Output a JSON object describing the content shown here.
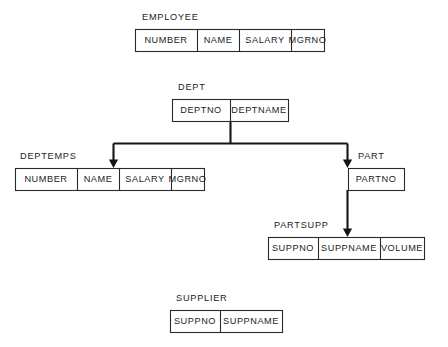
{
  "diagram": {
    "type": "database-schema-hierarchy",
    "background_color": "#ffffff",
    "stroke_color": "#151515",
    "text_color": "#1b1b1b",
    "entities": [
      {
        "id": "employee",
        "label": "EMPLOYEE",
        "label_x": 142,
        "label_y": 20,
        "box": {
          "x": 135,
          "y": 29,
          "width": 189,
          "height": 22
        },
        "columns": [
          {
            "name": "NUMBER",
            "x": 135,
            "width": 62
          },
          {
            "name": "NAME",
            "x": 197,
            "width": 42
          },
          {
            "name": "SALARY",
            "x": 239,
            "width": 52
          },
          {
            "name": "MGRNO",
            "x": 291,
            "width": 33
          }
        ]
      },
      {
        "id": "dept",
        "label": "DEPT",
        "label_x": 178,
        "label_y": 90,
        "box": {
          "x": 172,
          "y": 99,
          "width": 116,
          "height": 22
        },
        "columns": [
          {
            "name": "DEPTNO",
            "x": 172,
            "width": 58
          },
          {
            "name": "DEPTNAME",
            "x": 230,
            "width": 58
          }
        ]
      },
      {
        "id": "deptemps",
        "label": "DEPTEMPS",
        "label_x": 20,
        "label_y": 159,
        "box": {
          "x": 15,
          "y": 168,
          "width": 189,
          "height": 22
        },
        "columns": [
          {
            "name": "NUMBER",
            "x": 15,
            "width": 62
          },
          {
            "name": "NAME",
            "x": 77,
            "width": 42
          },
          {
            "name": "SALARY",
            "x": 119,
            "width": 52
          },
          {
            "name": "MGRNO",
            "x": 171,
            "width": 33
          }
        ]
      },
      {
        "id": "part",
        "label": "PART",
        "label_x": 358,
        "label_y": 159,
        "box": {
          "x": 348,
          "y": 168,
          "width": 56,
          "height": 22
        },
        "columns": [
          {
            "name": "PARTNO",
            "x": 348,
            "width": 56
          }
        ]
      },
      {
        "id": "partsupp",
        "label": "PARTSUPP",
        "label_x": 274,
        "label_y": 228,
        "box": {
          "x": 268,
          "y": 237,
          "width": 156,
          "height": 22
        },
        "columns": [
          {
            "name": "SUPPNO",
            "x": 268,
            "width": 50
          },
          {
            "name": "SUPPNAME",
            "x": 318,
            "width": 62
          },
          {
            "name": "VOLUME",
            "x": 380,
            "width": 44
          }
        ]
      },
      {
        "id": "supplier",
        "label": "SUPPLIER",
        "label_x": 176,
        "label_y": 301,
        "box": {
          "x": 170,
          "y": 310,
          "width": 112,
          "height": 22
        },
        "columns": [
          {
            "name": "SUPPNO",
            "x": 170,
            "width": 50
          },
          {
            "name": "SUPPNAME",
            "x": 220,
            "width": 62
          }
        ]
      }
    ],
    "connectors": [
      {
        "id": "dept-branch-stem",
        "from": "dept",
        "path": "M 230.5 121 L 230.5 143.5"
      },
      {
        "id": "dept-branch-bus",
        "from": "dept",
        "path": "M 113.5 143.5 L 347.5 143.5"
      },
      {
        "id": "dept-to-deptemps",
        "from": "dept",
        "to": "deptemps",
        "path": "M 113.5 143.5 L 113.5 161"
      },
      {
        "id": "dept-to-part",
        "from": "dept",
        "to": "part",
        "path": "M 347.5 143.5 L 347.5 161"
      },
      {
        "id": "part-to-partsupp",
        "from": "part",
        "to": "partsupp",
        "path": "M 347.5 190 L 347.5 230"
      }
    ],
    "arrow_heads": [
      {
        "id": "arrow-deptemps",
        "x": 113.5,
        "y": 168
      },
      {
        "id": "arrow-part",
        "x": 347.5,
        "y": 168
      },
      {
        "id": "arrow-partsupp",
        "x": 347.5,
        "y": 237
      }
    ]
  }
}
